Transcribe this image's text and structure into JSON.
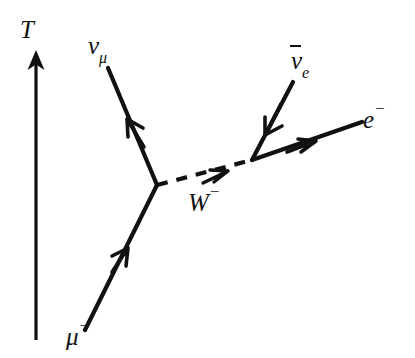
{
  "figure": {
    "kind": "feynman-diagram",
    "process": "muon decay",
    "background_color": "#ffffff",
    "line_color": "#111111",
    "width": 415,
    "height": 358
  },
  "axis": {
    "time_arrow_label": "T",
    "direction": "upward"
  },
  "labels": {
    "time": "T",
    "muon_neutrino_base": "ν",
    "muon_neutrino_sub": "μ",
    "electron_antineutrino_base": "ν",
    "electron_antineutrino_sub": "e",
    "electron_base": "e",
    "electron_sup": "−",
    "w_boson_base": "W",
    "w_boson_sup": "−",
    "muon_base": "μ",
    "muon_sup": "−"
  },
  "vertices": [
    {
      "name": "left-vertex",
      "x": 157,
      "y": 185
    },
    {
      "name": "right-vertex",
      "x": 252,
      "y": 160
    }
  ],
  "lines": [
    {
      "name": "muon-line",
      "particle": "μ−",
      "style": "solid",
      "from": {
        "x": 85,
        "y": 330
      },
      "to": {
        "x": 157,
        "y": 185
      },
      "arrow_at": {
        "x": 121,
        "y": 257
      },
      "arrow_direction": "toward-vertex"
    },
    {
      "name": "muon-neutrino-line",
      "particle": "νμ",
      "style": "solid",
      "from": {
        "x": 157,
        "y": 185
      },
      "to": {
        "x": 108,
        "y": 68
      },
      "arrow_at": {
        "x": 133,
        "y": 128
      },
      "arrow_direction": "away-from-vertex"
    },
    {
      "name": "w-boson-propagator",
      "particle": "W−",
      "style": "dashed",
      "from": {
        "x": 157,
        "y": 185
      },
      "to": {
        "x": 252,
        "y": 160
      },
      "arrow_at": {
        "x": 212,
        "y": 171
      },
      "arrow_direction": "left-to-right"
    },
    {
      "name": "electron-antineutrino-line",
      "particle": "ν̄e",
      "style": "solid",
      "from": {
        "x": 293,
        "y": 82
      },
      "to": {
        "x": 252,
        "y": 160
      },
      "arrow_at": {
        "x": 270,
        "y": 124
      },
      "arrow_direction": "toward-vertex"
    },
    {
      "name": "electron-line",
      "particle": "e−",
      "style": "solid",
      "from": {
        "x": 252,
        "y": 160
      },
      "to": {
        "x": 362,
        "y": 122
      },
      "arrow_at": {
        "x": 303,
        "y": 142
      },
      "arrow_direction": "away-from-vertex"
    },
    {
      "name": "time-axis-arrow",
      "particle": null,
      "style": "solid-arrow",
      "from": {
        "x": 36,
        "y": 340
      },
      "to": {
        "x": 36,
        "y": 52
      },
      "arrow_at": {
        "x": 36,
        "y": 56
      },
      "arrow_direction": "upward"
    }
  ]
}
